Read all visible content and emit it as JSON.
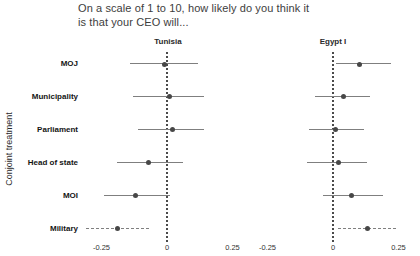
{
  "title_lines": [
    "On a scale of 1 to 10, how likely do you think it",
    "is that your CEO will..."
  ],
  "ylabel": "Conjoint treatment",
  "colors": {
    "point": "#474747",
    "whisker": "#7f7f7f",
    "zero_line": "#4a4a4a",
    "text": "#141414",
    "background": "#ffffff"
  },
  "chart_data": {
    "type": "scatter",
    "subtype": "faceted dot-whisker coefficient plot with horizontal confidence intervals",
    "title": "On a scale of 1 to 10, how likely do you think it is that your CEO will...",
    "xlabel": "",
    "ylabel": "Conjoint treatment",
    "grid": "off",
    "zero_reference_line": "dotted vertical line at x = 0 in each facet",
    "categories": [
      "MOJ",
      "Municipality",
      "Parliament",
      "Head of state",
      "MOI",
      "Military"
    ],
    "xticks": [
      -0.25,
      0,
      0.25
    ],
    "xtick_labels": [
      "-0.25",
      "0",
      "0.25"
    ],
    "xlim": [
      -0.34,
      0.34
    ],
    "facets": [
      {
        "label": "Tunisia",
        "points": [
          {
            "category": "MOJ",
            "estimate": -0.01,
            "ci_low": -0.14,
            "ci_high": 0.12,
            "line": "solid"
          },
          {
            "category": "Municipality",
            "estimate": 0.01,
            "ci_low": -0.13,
            "ci_high": 0.14,
            "line": "solid"
          },
          {
            "category": "Parliament",
            "estimate": 0.02,
            "ci_low": -0.11,
            "ci_high": 0.14,
            "line": "solid"
          },
          {
            "category": "Head of state",
            "estimate": -0.07,
            "ci_low": -0.19,
            "ci_high": 0.06,
            "line": "solid"
          },
          {
            "category": "MOI",
            "estimate": -0.12,
            "ci_low": -0.24,
            "ci_high": 0.01,
            "line": "solid"
          },
          {
            "category": "Military",
            "estimate": -0.19,
            "ci_low": -0.31,
            "ci_high": -0.07,
            "line": "dashed"
          }
        ]
      },
      {
        "label": "Egypt I",
        "points": [
          {
            "category": "MOJ",
            "estimate": 0.1,
            "ci_low": 0.01,
            "ci_high": 0.22,
            "line": "solid"
          },
          {
            "category": "Municipality",
            "estimate": 0.04,
            "ci_low": -0.07,
            "ci_high": 0.14,
            "line": "solid"
          },
          {
            "category": "Parliament",
            "estimate": 0.01,
            "ci_low": -0.09,
            "ci_high": 0.12,
            "line": "solid"
          },
          {
            "category": "Head of state",
            "estimate": 0.02,
            "ci_low": -0.1,
            "ci_high": 0.13,
            "line": "solid"
          },
          {
            "category": "MOI",
            "estimate": 0.07,
            "ci_low": -0.04,
            "ci_high": 0.19,
            "line": "solid"
          },
          {
            "category": "Military",
            "estimate": 0.13,
            "ci_low": 0.02,
            "ci_high": 0.24,
            "line": "dashed"
          }
        ]
      }
    ]
  }
}
